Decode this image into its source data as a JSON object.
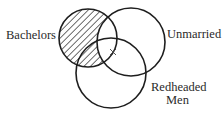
{
  "diagram": {
    "type": "venn",
    "sets": [
      {
        "id": "bachelors",
        "label": "Bachelors",
        "cx": 88,
        "cy": 38,
        "r": 29,
        "shaded": "only-outside-unmarried"
      },
      {
        "id": "unmarried",
        "label": "Unmarried",
        "cx": 131,
        "cy": 42,
        "r": 34
      },
      {
        "id": "redheaded",
        "label_line1": "Redheaded",
        "label_line2": "Men",
        "cx": 111,
        "cy": 73,
        "r": 35
      }
    ],
    "marker": {
      "symbol": "×",
      "x": 113,
      "y": 52,
      "region": "bachelors ∩ unmarried ∩ redheaded"
    },
    "shading": {
      "pattern": "diagonal-hatch",
      "region": "bachelors − unmarried"
    }
  },
  "labels": {
    "bachelors": "Bachelors",
    "unmarried": "Unmarried",
    "redheaded_line1": "Redheaded",
    "redheaded_line2": "Men"
  },
  "colors": {
    "stroke": "#1e1e1e",
    "text": "#2a2a2a",
    "background": "#ffffff"
  }
}
